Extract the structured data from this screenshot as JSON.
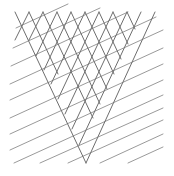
{
  "figure": {
    "background": "#ffffff",
    "stroke_color_steep": "#6e6e6e",
    "stroke_color_shallow": "#9a9a9a",
    "stroke_width": 1,
    "steep_lines": [
      {
        "x1": 15,
        "y1": 12,
        "x2": 86,
        "y2": 163
      },
      {
        "x1": 29,
        "y1": 12,
        "x2": 58,
        "y2": 74
      },
      {
        "x1": 29,
        "y1": 12,
        "x2": 15,
        "y2": 40
      },
      {
        "x1": 43,
        "y1": 12,
        "x2": 93,
        "y2": 118
      },
      {
        "x1": 43,
        "y1": 12,
        "x2": 29,
        "y2": 40
      },
      {
        "x1": 57,
        "y1": 12,
        "x2": 100,
        "y2": 104
      },
      {
        "x1": 57,
        "y1": 12,
        "x2": 36,
        "y2": 56
      },
      {
        "x1": 71,
        "y1": 12,
        "x2": 107,
        "y2": 89
      },
      {
        "x1": 71,
        "y1": 12,
        "x2": 44,
        "y2": 70
      },
      {
        "x1": 85,
        "y1": 12,
        "x2": 114,
        "y2": 74
      },
      {
        "x1": 85,
        "y1": 12,
        "x2": 51,
        "y2": 84
      },
      {
        "x1": 99,
        "y1": 12,
        "x2": 121,
        "y2": 59
      },
      {
        "x1": 99,
        "y1": 12,
        "x2": 58,
        "y2": 99
      },
      {
        "x1": 113,
        "y1": 12,
        "x2": 128,
        "y2": 44
      },
      {
        "x1": 113,
        "y1": 12,
        "x2": 65,
        "y2": 114
      },
      {
        "x1": 127,
        "y1": 12,
        "x2": 135,
        "y2": 29
      },
      {
        "x1": 127,
        "y1": 12,
        "x2": 72,
        "y2": 129
      },
      {
        "x1": 141,
        "y1": 12,
        "x2": 79,
        "y2": 145
      },
      {
        "x1": 155,
        "y1": 12,
        "x2": 86,
        "y2": 163
      }
    ],
    "shallow_lines": [
      {
        "x1": 16,
        "y1": 28,
        "x2": 68,
        "y2": 4
      },
      {
        "x1": 13,
        "y1": 48,
        "x2": 100,
        "y2": 8
      },
      {
        "x1": 11,
        "y1": 66,
        "x2": 128,
        "y2": 12
      },
      {
        "x1": 10,
        "y1": 84,
        "x2": 156,
        "y2": 17
      },
      {
        "x1": 10,
        "y1": 100,
        "x2": 163,
        "y2": 30
      },
      {
        "x1": 10,
        "y1": 118,
        "x2": 163,
        "y2": 48
      },
      {
        "x1": 10,
        "y1": 134,
        "x2": 163,
        "y2": 64
      },
      {
        "x1": 10,
        "y1": 150,
        "x2": 163,
        "y2": 80
      },
      {
        "x1": 14,
        "y1": 163,
        "x2": 163,
        "y2": 95
      },
      {
        "x1": 40,
        "y1": 163,
        "x2": 163,
        "y2": 108
      },
      {
        "x1": 68,
        "y1": 163,
        "x2": 163,
        "y2": 120
      },
      {
        "x1": 100,
        "y1": 163,
        "x2": 163,
        "y2": 134
      },
      {
        "x1": 128,
        "y1": 163,
        "x2": 163,
        "y2": 147
      }
    ]
  }
}
